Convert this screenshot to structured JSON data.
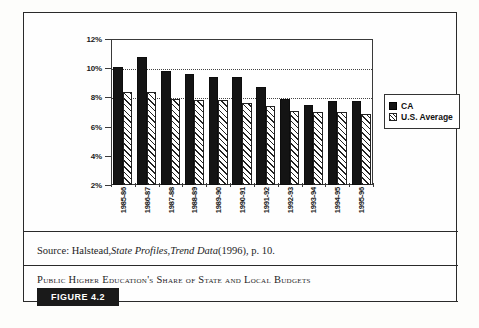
{
  "figure": {
    "badge_label": "FIGURE 4.2",
    "caption": "Public Higher Education's Share of State and Local Budgets",
    "source_prefix": "Source: Halstead, ",
    "source_italic_1": "State Profiles",
    "source_mid": ", ",
    "source_italic_2": "Trend Data",
    "source_suffix": " (1996), p. 10."
  },
  "chart_data": {
    "type": "bar",
    "title": "",
    "xlabel": "",
    "ylabel": "",
    "ylim": [
      2,
      12
    ],
    "ytick_step": 2,
    "ytick_labels": [
      "2%",
      "4%",
      "6%",
      "8%",
      "10%",
      "12%"
    ],
    "ytick_values": [
      2,
      4,
      6,
      8,
      10,
      12
    ],
    "gridlines": [
      8,
      10
    ],
    "grid": true,
    "legend_position": "right",
    "categories": [
      "1985-86",
      "1986-87",
      "1987-88",
      "1988-89",
      "1989-90",
      "1990-91",
      "1991-92",
      "1992-93",
      "1993-94",
      "1994-95",
      "1995-96"
    ],
    "series": [
      {
        "name": "CA",
        "color": "#141414",
        "fill": "solid",
        "values": [
          10.1,
          10.8,
          9.8,
          9.6,
          9.4,
          9.4,
          8.7,
          7.9,
          7.45,
          7.75,
          7.75
        ]
      },
      {
        "name": "U.S. Average",
        "color": "#ffffff",
        "fill": "hatched",
        "values": [
          8.35,
          8.35,
          7.9,
          7.85,
          7.85,
          7.65,
          7.4,
          7.05,
          7.0,
          7.0,
          6.85
        ]
      }
    ]
  }
}
